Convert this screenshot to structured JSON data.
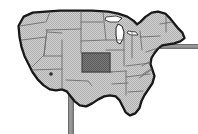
{
  "figure": {
    "kind": "raster-map-illustration",
    "title": "United States map with one highlighted state",
    "width": 198,
    "height": 134,
    "background_color": "#ffffff",
    "rendering_style": "low-resolution dithered halftone grayscale"
  },
  "map": {
    "region_label": "Contiguous United States",
    "fill_color": "#c9c9c9",
    "texture_color": "#b0b0b0",
    "outline_color": "#1d1d1d",
    "coast_shadow_color": "#101010",
    "state_border_color": "#6e6e6e",
    "state_border_width": 0.9,
    "projection_hint": "simplified equal-area outline"
  },
  "highlight": {
    "label": "Highlighted state",
    "state_name": "Kansas",
    "fill_color": "#777777",
    "texture_color": "#5c5c5c",
    "border_color": "#3a3a3a",
    "bounds": {
      "x": 82,
      "y": 53,
      "width": 28,
      "height": 19
    }
  },
  "marker": {
    "label": "City marker",
    "color": "#2a2a2a",
    "x": 51,
    "y": 74,
    "radius": 1.8
  },
  "pole": {
    "label": "Vertical pole",
    "color": "#8f8f8f",
    "edge_color": "#6b6b6b",
    "x": 68,
    "y": 86,
    "width": 6,
    "height": 48
  },
  "bar": {
    "label": "Horizontal bar",
    "color": "#8f8f8f",
    "edge_color": "#6b6b6b",
    "x": 160,
    "y": 44,
    "width": 38,
    "height": 5
  },
  "legend": {
    "visible": false,
    "entries": []
  },
  "labels": {
    "visible_text": []
  }
}
